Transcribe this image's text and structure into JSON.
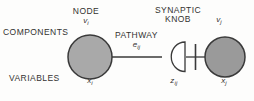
{
  "figure": {
    "type": "neural-synapse-diagram",
    "row_labels": {
      "components": "COMPONENTS",
      "variables": "VARIABLES"
    },
    "parts": {
      "node": {
        "title": "NODE",
        "component_symbol": "v",
        "component_subscript": "i",
        "variable_symbol": "x",
        "variable_subscript": "i",
        "shape": "filled-circle",
        "fill_color": "#a9a9a9",
        "stroke_color": "#3a3a3a"
      },
      "pathway": {
        "title": "PATHWAY",
        "component_symbol": "e",
        "component_subscript": "ij",
        "shape": "horizontal-line",
        "stroke_color": "#3a3a3a"
      },
      "synaptic_knob": {
        "title_line1": "SYNAPTIC",
        "title_line2": "KNOB",
        "variable_symbol": "z",
        "variable_subscript": "ij",
        "shape": "open-d-shape",
        "fill_color": "#ffffff",
        "stroke_color": "#3a3a3a"
      },
      "target_node": {
        "component_symbol": "v",
        "component_subscript": "j",
        "variable_symbol": "x",
        "variable_subscript": "j",
        "shape": "filled-circle",
        "fill_color": "#9a9a9a",
        "stroke_color": "#3a3a3a"
      },
      "membrane": {
        "shape": "vertical-bar",
        "stroke_color": "#3a3a3a"
      }
    },
    "background_color": "#fdfdfc"
  }
}
